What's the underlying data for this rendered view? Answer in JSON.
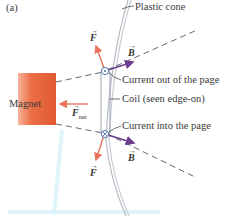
{
  "figure": {
    "panel_label": "(a)",
    "labels": {
      "plastic_cone": "Plastic cone",
      "current_out": "Current out of the page",
      "coil": "Coil (seen edge-on)",
      "current_in": "Current into the page",
      "magnet": "Magnet"
    },
    "vectors": {
      "force_top": "F",
      "field_top": "B",
      "force_net": "F",
      "force_net_sub": "net",
      "force_bottom": "F",
      "field_bottom": "B",
      "arrow_glyph": "→"
    },
    "colors": {
      "magnet": "#e8603a",
      "force": "#e8735a",
      "field": "#6a3d8f",
      "field_line": "#555566",
      "cone": "#b8bcc4",
      "coil": "#9aa3b3",
      "light_blue": "#d8f2f8"
    }
  }
}
